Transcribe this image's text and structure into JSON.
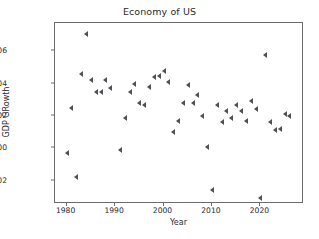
{
  "chart_data": {
    "type": "scatter",
    "title": "Economy of US",
    "xlabel": "Year",
    "ylabel": "GDP GRowth",
    "grid": false,
    "legend": null,
    "marker": "caret-left",
    "marker_color": "#4f4f56",
    "xlim": [
      1977.6,
      2029.0
    ],
    "ylim": [
      -0.0345,
      0.0775
    ],
    "xticks": [
      1980,
      1990,
      2000,
      2010,
      2020
    ],
    "xtick_labels": [
      "1980",
      "1990",
      "2000",
      "2010",
      "2020"
    ],
    "yticks": [
      -0.02,
      0.0,
      0.02,
      0.04,
      0.06
    ],
    "ytick_labels": [
      "-0.02",
      "0.00",
      "0.02",
      "0.04",
      "0.06"
    ],
    "x": [
      1980,
      1981,
      1982,
      1983,
      1984,
      1985,
      1986,
      1987,
      1988,
      1989,
      1991,
      1992,
      1993,
      1994,
      1995,
      1996,
      1997,
      1998,
      1999,
      2000,
      2001,
      2002,
      2003,
      2004,
      2005,
      2006,
      2007,
      2008,
      2009,
      2010,
      2011,
      2012,
      2013,
      2014,
      2015,
      2016,
      2017,
      2018,
      2019,
      2020,
      2021,
      2022,
      2023,
      2024,
      2025,
      2026
    ],
    "y": [
      -0.003,
      0.025,
      -0.018,
      0.046,
      0.071,
      0.042,
      0.035,
      0.035,
      0.042,
      0.037,
      -0.001,
      0.019,
      0.035,
      0.04,
      0.028,
      0.027,
      0.038,
      0.044,
      0.045,
      0.048,
      0.041,
      0.01,
      0.017,
      0.028,
      0.039,
      0.028,
      0.033,
      0.02,
      0.001,
      -0.026,
      0.027,
      0.016,
      0.023,
      0.019,
      0.027,
      0.023,
      0.017,
      0.029,
      0.024,
      -0.031,
      0.058,
      0.016,
      0.011,
      0.012,
      0.021,
      0.02
    ],
    "points": [
      {
        "year": 1980,
        "value": -0.003
      },
      {
        "year": 1981,
        "value": 0.025
      },
      {
        "year": 1982,
        "value": -0.018
      },
      {
        "year": 1983,
        "value": 0.046
      },
      {
        "year": 1984,
        "value": 0.071
      },
      {
        "year": 1985,
        "value": 0.042
      },
      {
        "year": 1986,
        "value": 0.035
      },
      {
        "year": 1987,
        "value": 0.035
      },
      {
        "year": 1988,
        "value": 0.042
      },
      {
        "year": 1989,
        "value": 0.037
      },
      {
        "year": 1991,
        "value": -0.001
      },
      {
        "year": 1992,
        "value": 0.019
      },
      {
        "year": 1993,
        "value": 0.035
      },
      {
        "year": 1994,
        "value": 0.04
      },
      {
        "year": 1995,
        "value": 0.028
      },
      {
        "year": 1996,
        "value": 0.027
      },
      {
        "year": 1997,
        "value": 0.038
      },
      {
        "year": 1998,
        "value": 0.044
      },
      {
        "year": 1999,
        "value": 0.045
      },
      {
        "year": 2000,
        "value": 0.048
      },
      {
        "year": 2001,
        "value": 0.041
      },
      {
        "year": 2002,
        "value": 0.01
      },
      {
        "year": 2003,
        "value": 0.017
      },
      {
        "year": 2004,
        "value": 0.028
      },
      {
        "year": 2005,
        "value": 0.039
      },
      {
        "year": 2006,
        "value": 0.028
      },
      {
        "year": 2007,
        "value": 0.033
      },
      {
        "year": 2008,
        "value": 0.02
      },
      {
        "year": 2009,
        "value": 0.001
      },
      {
        "year": 2010,
        "value": -0.026
      },
      {
        "year": 2011,
        "value": 0.027
      },
      {
        "year": 2012,
        "value": 0.016
      },
      {
        "year": 2013,
        "value": 0.023
      },
      {
        "year": 2014,
        "value": 0.019
      },
      {
        "year": 2015,
        "value": 0.027
      },
      {
        "year": 2016,
        "value": 0.023
      },
      {
        "year": 2017,
        "value": 0.017
      },
      {
        "year": 2018,
        "value": 0.029
      },
      {
        "year": 2019,
        "value": 0.024
      },
      {
        "year": 2020,
        "value": -0.031
      },
      {
        "year": 2021,
        "value": 0.058
      },
      {
        "year": 2022,
        "value": 0.016
      },
      {
        "year": 2023,
        "value": 0.011
      },
      {
        "year": 2024,
        "value": 0.012
      },
      {
        "year": 2025,
        "value": 0.021
      },
      {
        "year": 2026,
        "value": 0.02
      }
    ]
  }
}
